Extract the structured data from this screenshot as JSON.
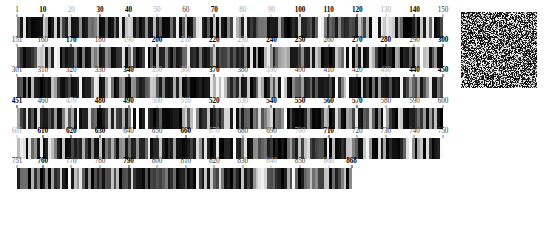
{
  "page": {
    "background_color": "#ffffff",
    "width": 546,
    "height": 241
  },
  "chart_data": {
    "type": "bar",
    "xlabel": "",
    "ylabel": "",
    "grid": false,
    "legend": null,
    "strip_count": 6,
    "positions_per_strip": 150,
    "total_positions": 868,
    "value_range": [
      0,
      1
    ],
    "strips": [
      {
        "name": "strip-1",
        "start": 1,
        "end": 150,
        "tick_labels": [
          "1",
          "10",
          "20",
          "30",
          "40",
          "50",
          "60",
          "70",
          "80",
          "90",
          "100",
          "110",
          "120",
          "130",
          "140",
          "150"
        ],
        "tick_values": [
          1,
          10,
          20,
          30,
          40,
          50,
          60,
          70,
          80,
          90,
          100,
          110,
          120,
          130,
          140,
          150
        ],
        "tick_emphasis": [
          "mid",
          "strong",
          "faint",
          "strong",
          "strong",
          "faint",
          "mid",
          "strong",
          "faint",
          "faint",
          "strong",
          "strong",
          "strong",
          "faint",
          "strong",
          "mid"
        ]
      },
      {
        "name": "strip-2",
        "start": 151,
        "end": 300,
        "tick_labels": [
          "151",
          "160",
          "170",
          "180",
          "190",
          "200",
          "210",
          "220",
          "230",
          "240",
          "250",
          "260",
          "270",
          "280",
          "290",
          "300"
        ],
        "tick_values": [
          151,
          160,
          170,
          180,
          190,
          200,
          210,
          220,
          230,
          240,
          250,
          260,
          270,
          280,
          290,
          300
        ],
        "tick_emphasis": [
          "mid",
          "mid",
          "strong",
          "mid",
          "faint",
          "strong",
          "faint",
          "strong",
          "faint",
          "strong",
          "strong",
          "mid",
          "strong",
          "strong",
          "mid",
          "strong"
        ]
      },
      {
        "name": "strip-3",
        "start": 301,
        "end": 450,
        "tick_labels": [
          "301",
          "310",
          "320",
          "330",
          "340",
          "350",
          "360",
          "370",
          "380",
          "390",
          "400",
          "410",
          "420",
          "430",
          "440",
          "450"
        ],
        "tick_values": [
          301,
          310,
          320,
          330,
          340,
          350,
          360,
          370,
          380,
          390,
          400,
          410,
          420,
          430,
          440,
          450
        ],
        "tick_emphasis": [
          "mid",
          "mid",
          "mid",
          "mid",
          "strong",
          "faint",
          "faint",
          "strong",
          "mid",
          "faint",
          "mid",
          "mid",
          "mid",
          "faint",
          "strong",
          "strong"
        ]
      },
      {
        "name": "strip-4",
        "start": 451,
        "end": 600,
        "tick_labels": [
          "451",
          "460",
          "470",
          "480",
          "490",
          "500",
          "510",
          "520",
          "530",
          "540",
          "550",
          "560",
          "570",
          "580",
          "590",
          "600"
        ],
        "tick_values": [
          451,
          460,
          470,
          480,
          490,
          500,
          510,
          520,
          530,
          540,
          550,
          560,
          570,
          580,
          590,
          600
        ],
        "tick_emphasis": [
          "strong",
          "mid",
          "faint",
          "strong",
          "strong",
          "faint",
          "faint",
          "strong",
          "faint",
          "strong",
          "strong",
          "strong",
          "strong",
          "mid",
          "mid",
          "mid"
        ]
      },
      {
        "name": "strip-5",
        "start": 601,
        "end": 750,
        "tick_labels": [
          "601",
          "610",
          "620",
          "630",
          "640",
          "650",
          "660",
          "670",
          "680",
          "690",
          "700",
          "710",
          "720",
          "730",
          "740",
          "750"
        ],
        "tick_values": [
          601,
          610,
          620,
          630,
          640,
          650,
          660,
          670,
          680,
          690,
          700,
          710,
          720,
          730,
          740,
          750
        ],
        "tick_emphasis": [
          "faint",
          "strong",
          "strong",
          "strong",
          "mid",
          "mid",
          "strong",
          "faint",
          "mid",
          "mid",
          "faint",
          "strong",
          "mid",
          "mid",
          "mid",
          "mid"
        ]
      },
      {
        "name": "strip-6",
        "start": 751,
        "end": 868,
        "tick_labels": [
          "751",
          "760",
          "770",
          "780",
          "790",
          "800",
          "810",
          "820",
          "830",
          "840",
          "850",
          "860",
          "868"
        ],
        "tick_values": [
          751,
          760,
          770,
          780,
          790,
          800,
          810,
          820,
          830,
          840,
          850,
          860,
          868
        ],
        "tick_emphasis": [
          "mid",
          "strong",
          "mid",
          "mid",
          "strong",
          "mid",
          "mid",
          "mid",
          "mid",
          "faint",
          "mid",
          "faint",
          "strong"
        ]
      }
    ]
  },
  "noise_block": {
    "name": "noise-image",
    "x": 461,
    "y": 12,
    "width": 76,
    "height": 76,
    "description": "Square block of black-and-white random speckle noise"
  }
}
